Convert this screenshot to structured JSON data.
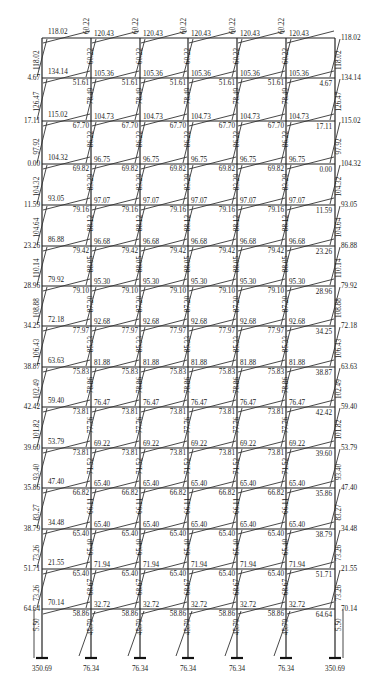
{
  "diagram": {
    "type": "frame-bending-moment-diagram",
    "columns_x": [
      42,
      91,
      140,
      188,
      237,
      286,
      335
    ],
    "floor_y": [
      38,
      78,
      121,
      164,
      205,
      246,
      286,
      326,
      367,
      407,
      448,
      488,
      529,
      569,
      609
    ],
    "base_y": 658,
    "stories": [
      {
        "edge_beam_left": "118.02",
        "edge_col_left": "118.02",
        "beam_ends": [
          "120.43",
          "120.43",
          "120.43",
          "120.43",
          "120.43"
        ],
        "col_top": [
          "60.22",
          "60.22",
          "60.22",
          "60.22",
          "60.22"
        ],
        "col_bot": [
          "60.22",
          "60.22",
          "60.22",
          "60.22",
          "60.22"
        ],
        "right_beam": "118.02",
        "right_col": "118.02"
      },
      {
        "edge_beam_left": "134.14",
        "edge_left_small": "4.67",
        "edge_col_left": "126.47",
        "beam_ends": [
          "105.36",
          "105.36",
          "105.36",
          "105.36",
          "105.36"
        ],
        "beam_far": [
          "51.61",
          "51.61",
          "51.61",
          "51.61",
          "51.61"
        ],
        "col_top": [
          "78.49",
          "78.49",
          "78.49",
          "78.49",
          "78.49"
        ],
        "right_beam": "134.14",
        "right_small": "4.67",
        "right_col": "126.47"
      },
      {
        "edge_beam_left": "115.02",
        "edge_left_small": "17.11",
        "edge_col_left": "97.92",
        "beam_ends": [
          "104.73",
          "104.73",
          "104.73",
          "104.73",
          "104.73"
        ],
        "beam_far": [
          "67.70",
          "67.70",
          "67.70",
          "67.70",
          "67.70"
        ],
        "col_top": [
          "86.22",
          "86.22",
          "86.22",
          "86.22",
          "86.22"
        ],
        "right_beam": "115.02",
        "right_small": "17.11",
        "right_col": "97.92"
      },
      {
        "edge_beam_left": "104.32",
        "edge_left_small": "0.00",
        "edge_col_left": "104.32",
        "beam_ends": [
          "96.75",
          "96.75",
          "96.75",
          "96.75",
          "96.75"
        ],
        "beam_far": [
          "69.82",
          "69.82",
          "69.82",
          "69.82",
          "69.82"
        ],
        "col_top": [
          "83.29",
          "83.29",
          "83.29",
          "83.29",
          "83.29"
        ],
        "right_beam": "104.32",
        "right_small": "0.00",
        "right_col": "104.32"
      },
      {
        "edge_beam_left": "93.05",
        "edge_left_small": "11.59",
        "edge_col_left": "104.64",
        "beam_ends": [
          "97.07",
          "97.07",
          "97.07",
          "97.07",
          "97.07"
        ],
        "beam_far": [
          "79.16",
          "79.16",
          "79.16",
          "79.16",
          "79.16"
        ],
        "col_top": [
          "88.12",
          "88.12",
          "88.12",
          "88.12",
          "88.12"
        ],
        "right_beam": "93.05",
        "right_small": "11.59",
        "right_col": "104.64"
      },
      {
        "edge_beam_left": "86.88",
        "edge_left_small": "23.26",
        "edge_col_left": "110.14",
        "beam_ends": [
          "96.68",
          "96.68",
          "96.68",
          "96.68",
          "96.68"
        ],
        "beam_far": [
          "79.42",
          "79.42",
          "79.42",
          "79.42",
          "79.42"
        ],
        "col_top": [
          "88.05",
          "88.05",
          "88.05",
          "88.05",
          "88.05"
        ],
        "right_beam": "86.88",
        "right_small": "23.26",
        "right_col": "110.14"
      },
      {
        "edge_beam_left": "79.92",
        "edge_left_small": "28.96",
        "edge_col_left": "108.88",
        "beam_ends": [
          "95.30",
          "95.30",
          "95.30",
          "95.30",
          "95.30"
        ],
        "beam_far": [
          "79.10",
          "79.10",
          "79.10",
          "79.10",
          "79.10"
        ],
        "col_top": [
          "87.20",
          "87.20",
          "87.20",
          "87.20",
          "87.20"
        ],
        "right_beam": "79.92",
        "right_small": "28.96",
        "right_col": "108.88"
      },
      {
        "edge_beam_left": "72.18",
        "edge_left_small": "34.25",
        "edge_col_left": "106.43",
        "beam_ends": [
          "92.68",
          "92.68",
          "92.68",
          "92.68",
          "92.68"
        ],
        "beam_far": [
          "77.97",
          "77.97",
          "77.97",
          "77.97",
          "77.97"
        ],
        "col_top": [
          "85.33",
          "85.33",
          "85.33",
          "85.33",
          "85.33"
        ],
        "right_beam": "72.18",
        "right_small": "34.25",
        "right_col": "106.43"
      },
      {
        "edge_beam_left": "63.63",
        "edge_left_small": "38.87",
        "edge_col_left": "102.49",
        "beam_ends": [
          "81.88",
          "81.88",
          "81.88",
          "81.88",
          "81.88"
        ],
        "beam_far": [
          "75.83",
          "75.83",
          "75.83",
          "75.83",
          "75.83"
        ],
        "col_top": [
          "78.86",
          "78.86",
          "78.86",
          "78.86",
          "78.86"
        ],
        "right_beam": "63.63",
        "right_small": "38.87",
        "right_col": "102.49"
      },
      {
        "edge_beam_left": "59.40",
        "edge_left_small": "42.42",
        "edge_col_left": "101.82",
        "beam_ends": [
          "76.47",
          "76.47",
          "76.47",
          "76.47",
          "76.47"
        ],
        "beam_far": [
          "73.81",
          "73.81",
          "73.81",
          "73.81",
          "73.81"
        ],
        "col_top": [
          "77.76",
          "77.76",
          "77.76",
          "77.76",
          "77.76"
        ],
        "right_beam": "59.40",
        "right_small": "42.42",
        "right_col": "101.82"
      },
      {
        "edge_beam_left": "53.79",
        "edge_left_small": "39.60",
        "edge_col_left": "93.40",
        "beam_ends": [
          "69.22",
          "69.22",
          "69.22",
          "69.22",
          "69.22"
        ],
        "beam_far": [
          "73.81",
          "73.81",
          "73.81",
          "73.81",
          "73.81"
        ],
        "col_top": [
          "71.52",
          "71.52",
          "71.52",
          "71.52",
          "71.52"
        ],
        "right_beam": "53.79",
        "right_small": "39.60",
        "right_col": "93.40"
      },
      {
        "edge_beam_left": "47.40",
        "edge_left_small": "35.86",
        "edge_col_left": "83.27",
        "beam_ends": [
          "65.40",
          "65.40",
          "65.40",
          "65.40",
          "65.40"
        ],
        "beam_far": [
          "66.82",
          "66.82",
          "66.82",
          "66.82",
          "66.82"
        ],
        "col_top": [
          "66.11",
          "66.11",
          "66.11",
          "66.11",
          "66.11"
        ],
        "right_beam": "47.40",
        "right_small": "35.86",
        "right_col": "83.27"
      },
      {
        "edge_beam_left": "34.48",
        "edge_left_small": "38.79",
        "edge_col_left": "73.26",
        "beam_ends": [
          "65.40",
          "65.40",
          "65.40",
          "65.40",
          "65.40"
        ],
        "beam_far": [
          "65.40",
          "65.40",
          "65.40",
          "65.40",
          "65.40"
        ],
        "col_top": [
          "65.40",
          "65.40",
          "65.40",
          "65.40",
          "65.40"
        ],
        "right_beam": "34.48",
        "right_small": "38.79",
        "right_col": "73.26"
      },
      {
        "edge_beam_left": "21.55",
        "edge_left_small": "51.71",
        "edge_col_left": "73.26",
        "beam_ends": [
          "71.94",
          "71.94",
          "71.94",
          "71.94",
          "71.94"
        ],
        "beam_far": [
          "65.40",
          "65.40",
          "65.40",
          "65.40",
          "65.40"
        ],
        "col_top": [
          "68.67",
          "68.67",
          "68.67",
          "68.67",
          "68.67"
        ],
        "right_beam": "21.55",
        "right_small": "51.71",
        "right_col": "73.26"
      },
      {
        "edge_beam_left": "70.14",
        "edge_left_small": "64.64",
        "edge_col_left": "5.50",
        "beam_ends": [
          "32.72",
          "32.72",
          "32.72",
          "32.72",
          "32.72"
        ],
        "beam_far": [
          "58.86",
          "58.86",
          "58.86",
          "58.86",
          "58.86"
        ],
        "col_top": [
          "45.79",
          "45.79",
          "45.79",
          "45.79",
          "45.79"
        ],
        "right_beam": "70.14",
        "right_small": "64.64",
        "right_col": "5.50"
      }
    ],
    "base_moments": [
      "350.69",
      "76.34",
      "76.34",
      "76.34",
      "76.34",
      "76.34",
      "350.69"
    ]
  }
}
